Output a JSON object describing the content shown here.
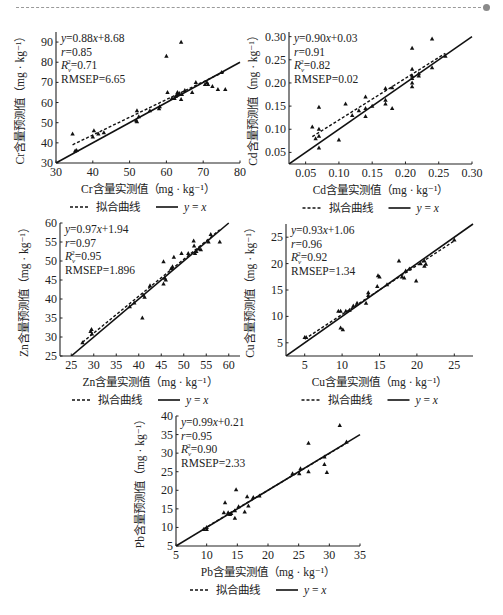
{
  "header": {
    "rule": "dashed-separator"
  },
  "legend": {
    "fit_label": "拟合曲线",
    "identity_label": "y = x"
  },
  "chart_data": [
    {
      "type": "scatter",
      "element": "Cr",
      "xlabel": "Cr含量实测值（mg · kg⁻¹）",
      "ylabel": "Cr含量预测值（mg · kg⁻¹）",
      "xlim": [
        30,
        80
      ],
      "ylim": [
        30,
        95
      ],
      "xticks": [
        30,
        40,
        50,
        60,
        70,
        80
      ],
      "yticks": [
        30,
        40,
        50,
        60,
        70,
        80,
        90
      ],
      "stats": {
        "equation": "y=0.88x+8.68",
        "r": "r=0.85",
        "r2": "0.71",
        "rmsep": "RMSEP=6.65"
      },
      "fit": {
        "slope": 0.88,
        "intercept": 8.68,
        "x_range": [
          34.5,
          76
        ]
      },
      "identity": {
        "x_range": [
          30,
          80
        ]
      },
      "points": [
        [
          34.5,
          44.5
        ],
        [
          35.2,
          36
        ],
        [
          35.6,
          36.2
        ],
        [
          40,
          43
        ],
        [
          40.3,
          46
        ],
        [
          41.5,
          44.5
        ],
        [
          43,
          45
        ],
        [
          51.8,
          51
        ],
        [
          52,
          56
        ],
        [
          52,
          50.5
        ],
        [
          52.5,
          53
        ],
        [
          55.5,
          56
        ],
        [
          58,
          57
        ],
        [
          58.2,
          58
        ],
        [
          60,
          83
        ],
        [
          60.3,
          65
        ],
        [
          61.5,
          62
        ],
        [
          62.2,
          62
        ],
        [
          62.5,
          63
        ],
        [
          63,
          65
        ],
        [
          63,
          64
        ],
        [
          63.5,
          64.5
        ],
        [
          64,
          90
        ],
        [
          64,
          61.5
        ],
        [
          64.2,
          64
        ],
        [
          65,
          66
        ],
        [
          67,
          65
        ],
        [
          68,
          70
        ],
        [
          70.5,
          69
        ],
        [
          71,
          70
        ],
        [
          71.3,
          69
        ],
        [
          72.5,
          68
        ],
        [
          74,
          66.5
        ],
        [
          76,
          66.5
        ],
        [
          75,
          75
        ]
      ],
      "legend": [
        "拟合曲线",
        "y = x"
      ]
    },
    {
      "type": "scatter",
      "element": "Cd",
      "xlabel": "Cd含量实测值（mg · kg⁻¹）",
      "ylabel": "Cd含量预测值（mg · kg⁻¹）",
      "xlim": [
        0.025,
        0.3
      ],
      "ylim": [
        0.025,
        0.31
      ],
      "xticks": [
        0.05,
        0.1,
        0.15,
        0.2,
        0.25,
        0.3
      ],
      "yticks": [
        0.05,
        0.1,
        0.15,
        0.2,
        0.25,
        0.3
      ],
      "stats": {
        "equation": "y=0.90x+0.03",
        "r": "r=0.91",
        "r2": "0.82",
        "rmsep": "RMSEP=0.02"
      },
      "fit": {
        "slope": 0.9,
        "intercept": 0.03,
        "x_range": [
          0.06,
          0.26
        ]
      },
      "identity": {
        "x_range": [
          0.025,
          0.3
        ]
      },
      "points": [
        [
          0.06,
          0.105
        ],
        [
          0.065,
          0.08
        ],
        [
          0.07,
          0.148
        ],
        [
          0.07,
          0.1
        ],
        [
          0.07,
          0.085
        ],
        [
          0.07,
          0.06
        ],
        [
          0.1,
          0.077
        ],
        [
          0.11,
          0.155
        ],
        [
          0.12,
          0.13
        ],
        [
          0.13,
          0.14
        ],
        [
          0.14,
          0.17
        ],
        [
          0.14,
          0.128
        ],
        [
          0.14,
          0.145
        ],
        [
          0.15,
          0.15
        ],
        [
          0.17,
          0.188
        ],
        [
          0.17,
          0.163
        ],
        [
          0.17,
          0.155
        ],
        [
          0.18,
          0.19
        ],
        [
          0.18,
          0.145
        ],
        [
          0.21,
          0.275
        ],
        [
          0.21,
          0.23
        ],
        [
          0.21,
          0.21
        ],
        [
          0.21,
          0.2
        ],
        [
          0.21,
          0.192
        ],
        [
          0.21,
          0.215
        ],
        [
          0.22,
          0.215
        ],
        [
          0.22,
          0.22
        ],
        [
          0.24,
          0.295
        ],
        [
          0.24,
          0.233
        ],
        [
          0.26,
          0.258
        ]
      ],
      "legend": [
        "拟合曲线",
        "y = x"
      ]
    },
    {
      "type": "scatter",
      "element": "Zn",
      "xlabel": "Zn含量实测值（mg · kg⁻¹）",
      "ylabel": "Zn含量预测值（mg · kg⁻¹）",
      "xlim": [
        22.5,
        62.5
      ],
      "ylim": [
        25,
        60
      ],
      "xticks": [
        25,
        30,
        35,
        40,
        45,
        50,
        55,
        60
      ],
      "yticks": [
        25,
        30,
        35,
        40,
        45,
        50,
        55,
        60
      ],
      "stats": {
        "equation": "y=0.97x+1.94",
        "r": "r=0.97",
        "r2": "0.95",
        "rmsep": "RMSEP=1.896"
      },
      "fit": {
        "slope": 0.97,
        "intercept": 1.94,
        "x_range": [
          27.5,
          58
        ]
      },
      "identity": {
        "x_range": [
          25,
          60
        ]
      },
      "points": [
        [
          27.5,
          28.5
        ],
        [
          29.3,
          31.5
        ],
        [
          29.5,
          32
        ],
        [
          29.6,
          30.8
        ],
        [
          38,
          38
        ],
        [
          39,
          39
        ],
        [
          40.8,
          35
        ],
        [
          41,
          41
        ],
        [
          41.3,
          40.5
        ],
        [
          42.5,
          43.5
        ],
        [
          45.5,
          49.8
        ],
        [
          45.5,
          44
        ],
        [
          45.8,
          45.5
        ],
        [
          46,
          45
        ],
        [
          47.2,
          48
        ],
        [
          47.5,
          48.5
        ],
        [
          47.8,
          51
        ],
        [
          49.5,
          52
        ],
        [
          51,
          52
        ],
        [
          52.2,
          55.3
        ],
        [
          52.3,
          54
        ],
        [
          52.5,
          52
        ],
        [
          52.8,
          52.5
        ],
        [
          53.3,
          53.2
        ],
        [
          53.8,
          53
        ],
        [
          55.5,
          55
        ],
        [
          56,
          57
        ],
        [
          58,
          55
        ]
      ],
      "legend": [
        "拟合曲线",
        "y = x"
      ]
    },
    {
      "type": "scatter",
      "element": "Cu",
      "xlabel": "Cu含量实测值（mg · kg⁻¹）",
      "ylabel": "Cu含量预测值（mg · kg⁻¹）",
      "xlim": [
        2.5,
        27.5
      ],
      "ylim": [
        2.5,
        27.5
      ],
      "xticks": [
        5,
        10,
        15,
        20,
        25
      ],
      "yticks": [
        5,
        10,
        15,
        20,
        25
      ],
      "stats": {
        "equation": "y=0.93x+1.06",
        "r": "r=0.96",
        "r2": "0.92",
        "rmsep": "RMSEP=1.34"
      },
      "fit": {
        "slope": 0.93,
        "intercept": 1.06,
        "x_range": [
          5,
          25
        ]
      },
      "identity": {
        "x_range": [
          2.5,
          27.5
        ]
      },
      "points": [
        [
          5,
          6
        ],
        [
          5.2,
          6
        ],
        [
          9.5,
          11
        ],
        [
          9.8,
          11
        ],
        [
          9.8,
          7.8
        ],
        [
          10.1,
          7.5
        ],
        [
          10.5,
          11
        ],
        [
          11,
          11.2
        ],
        [
          11.5,
          12
        ],
        [
          12,
          12.5
        ],
        [
          13.2,
          12.5
        ],
        [
          13.5,
          14.5
        ],
        [
          13.5,
          14
        ],
        [
          14.8,
          17.7
        ],
        [
          15,
          17.5
        ],
        [
          14.7,
          15.7
        ],
        [
          16,
          16
        ],
        [
          17.6,
          20.5
        ],
        [
          18,
          17.5
        ],
        [
          18.3,
          17.3
        ],
        [
          18.5,
          18.6
        ],
        [
          19,
          19
        ],
        [
          19.9,
          16.7
        ],
        [
          20.5,
          20
        ],
        [
          21,
          19.5
        ],
        [
          21,
          20.5
        ],
        [
          21.2,
          19.9
        ],
        [
          25,
          24.5
        ]
      ],
      "legend": [
        "拟合曲线",
        "y = x"
      ]
    },
    {
      "type": "scatter",
      "element": "Pb",
      "xlabel": "Pb含量实测值（mg · kg⁻¹）",
      "ylabel": "Pb含量预测值（mg · kg⁻¹）",
      "xlim": [
        5,
        35
      ],
      "ylim": [
        5,
        40
      ],
      "xticks": [
        5,
        10,
        15,
        20,
        25,
        30,
        35
      ],
      "yticks": [
        5,
        10,
        15,
        20,
        25,
        30,
        35,
        40
      ],
      "stats": {
        "equation": "y=0.99x+0.21",
        "r": "r=0.95",
        "r2": "0.90",
        "rmsep": "RMSEP=2.33"
      },
      "fit": {
        "slope": 0.99,
        "intercept": 0.21,
        "x_range": [
          9.5,
          33
        ]
      },
      "identity": {
        "x_range": [
          5,
          35
        ]
      },
      "points": [
        [
          9.5,
          9.5
        ],
        [
          10,
          9.5
        ],
        [
          10,
          10
        ],
        [
          12.8,
          14
        ],
        [
          13,
          16.7
        ],
        [
          13.5,
          14
        ],
        [
          13.8,
          13.5
        ],
        [
          14,
          13.8
        ],
        [
          14.6,
          12.5
        ],
        [
          14.8,
          20.2
        ],
        [
          14.6,
          14.5
        ],
        [
          15.2,
          15.6
        ],
        [
          16.2,
          14.2
        ],
        [
          16.6,
          18.3
        ],
        [
          16.8,
          15.8
        ],
        [
          17.6,
          18.1
        ],
        [
          18.6,
          18.5
        ],
        [
          24,
          24.5
        ],
        [
          25.1,
          24.5
        ],
        [
          25.3,
          25.8
        ],
        [
          26.6,
          32.7
        ],
        [
          26.6,
          25
        ],
        [
          29.2,
          29
        ],
        [
          29.2,
          27
        ],
        [
          29.6,
          24.8
        ],
        [
          31.7,
          37.5
        ],
        [
          32.8,
          33
        ]
      ],
      "legend": [
        "拟合曲线",
        "y = x"
      ]
    }
  ],
  "layout": [
    {
      "left": 56,
      "top": 32,
      "width": 184,
      "height": 131
    },
    {
      "left": 289,
      "top": 32,
      "width": 183,
      "height": 132
    },
    {
      "left": 60,
      "top": 223,
      "width": 180,
      "height": 133
    },
    {
      "left": 286,
      "top": 224,
      "width": 187,
      "height": 132
    },
    {
      "left": 176,
      "top": 416,
      "width": 184,
      "height": 130
    }
  ]
}
